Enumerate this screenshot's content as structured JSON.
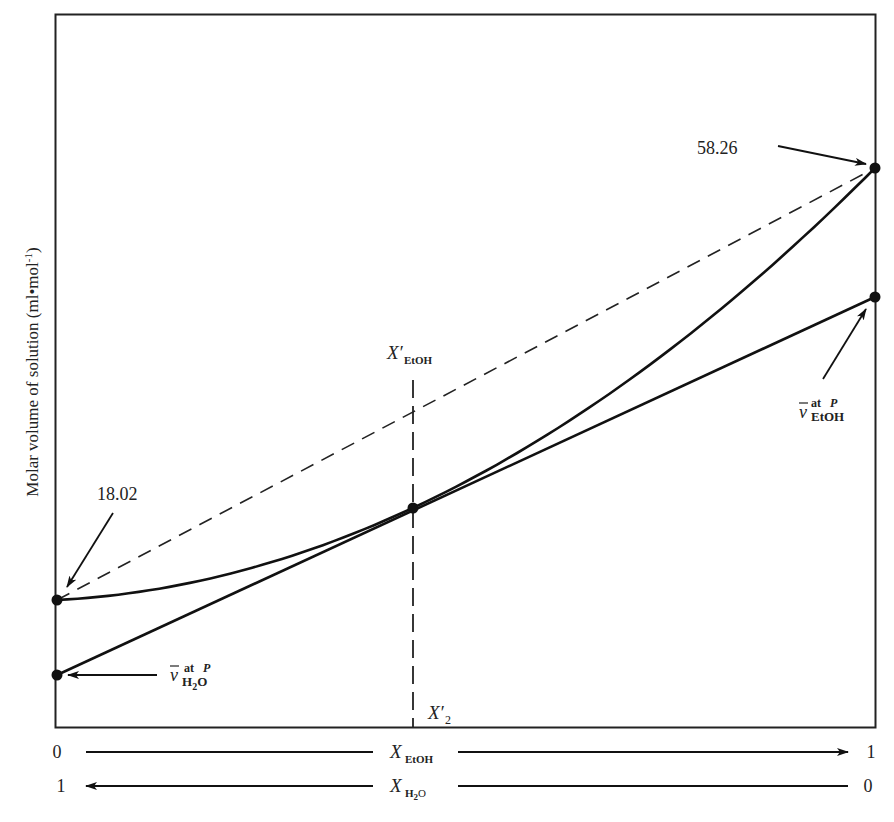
{
  "chart_data": {
    "type": "line",
    "title": "",
    "ylabel": "Molar volume of solution (ml•mol⁻¹)",
    "xlabel_top": "X_EtOH",
    "xlabel_bottom": "X_H2O",
    "x_axis_ethanol": {
      "left": "0",
      "right": "1",
      "label_main": "X",
      "label_sub": "EtOH"
    },
    "x_axis_water": {
      "left": "1",
      "right": "0",
      "label_main": "X",
      "label_sub": "H₂O"
    },
    "grid": false,
    "xlim": [
      0,
      1
    ],
    "series": [
      {
        "name": "Molar volume of solution (curve)",
        "style": "solid",
        "points_x": [
          0,
          0.1,
          0.2,
          0.3,
          0.435,
          0.5,
          0.6,
          0.7,
          0.8,
          0.9,
          1.0
        ],
        "endpoints": {
          "x0_value": 18.02,
          "x1_value": 58.26
        }
      },
      {
        "name": "Ideal mixing line",
        "style": "dashed",
        "from": {
          "x": 0,
          "value": 18.02
        },
        "to": {
          "x": 1,
          "value": 58.26
        }
      },
      {
        "name": "Tangent at X'_EtOH",
        "style": "solid",
        "tangent_x": 0.435,
        "intercepts": {
          "x0": "v̄ at P, H2O",
          "x1": "v̄ at P, EtOH"
        }
      }
    ],
    "annotations": [
      {
        "text": "58.26",
        "target": "curve endpoint at X_EtOH = 1"
      },
      {
        "text": "18.02",
        "target": "curve endpoint at X_EtOH = 0"
      },
      {
        "text": "v̄ at P EtOH",
        "target": "tangent intercept at X_EtOH = 1"
      },
      {
        "text": "v̄ at P H2O",
        "target": "tangent intercept at X_EtOH = 0"
      },
      {
        "text": "X'_EtOH",
        "target": "vertical dashed line at tangent point"
      },
      {
        "text": "X'_2",
        "target": "foot of vertical dashed line on x-axis"
      }
    ]
  },
  "labels": {
    "ylabel": "Molar volume of solution (ml•mol",
    "ylabel_sup": "-1",
    "ylabel_close": ")",
    "val_ethanol": "58.26",
    "val_water": "18.02",
    "vbar": "v",
    "at_p_at": "at",
    "at_p_p": "P",
    "sub_etoh": "EtOH",
    "sub_h": "H",
    "sub_2": "2",
    "sub_o": "O",
    "x_main": "X",
    "x_prime": "′",
    "x_prime_sub": "2",
    "axis_zero": "0",
    "axis_one": "1"
  },
  "geometry": {
    "frame": {
      "left": 55,
      "top": 14,
      "right": 875,
      "bottom": 727
    },
    "curve_y_left": 600,
    "curve_y_right": 168,
    "tangent_y_left": 675,
    "tangent_y_right": 297,
    "tangent_point": {
      "x": 413,
      "y": 508
    },
    "quad_a": -42,
    "quad_b": -390
  }
}
